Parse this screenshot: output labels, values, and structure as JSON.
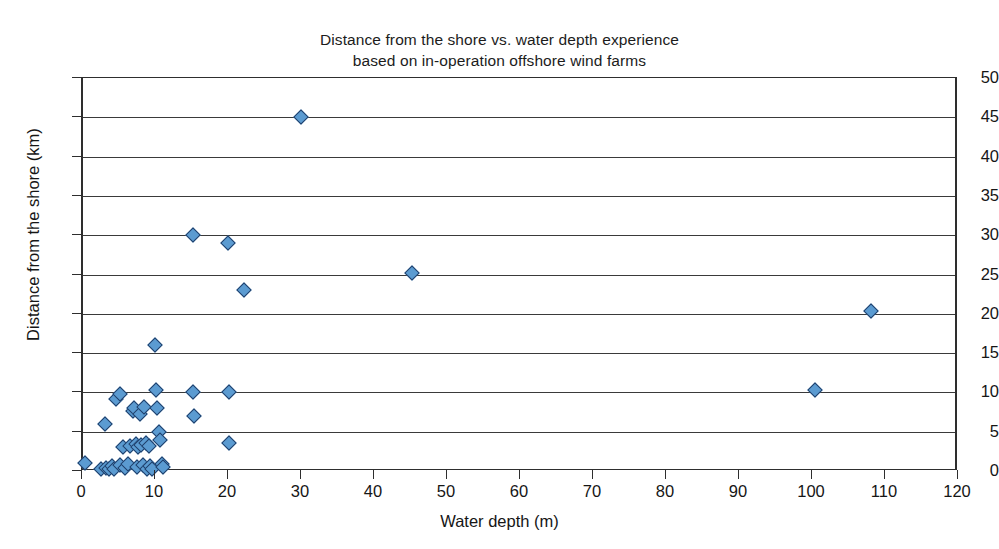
{
  "chart_data": {
    "type": "scatter",
    "title": "Distance from the shore vs. water depth experience\nbased on in-operation offshore wind farms",
    "title_line1": "Distance from the shore vs. water depth experience",
    "title_line2": "based on in-operation offshore wind farms",
    "xlabel": "Water depth (m)",
    "ylabel": "Distance from the shore (km)",
    "xlim": [
      0,
      120
    ],
    "ylim": [
      0,
      50
    ],
    "xticks": [
      0,
      10,
      20,
      30,
      40,
      50,
      60,
      70,
      80,
      90,
      100,
      110,
      120
    ],
    "yticks": [
      0,
      5,
      10,
      15,
      20,
      25,
      30,
      35,
      40,
      45,
      50
    ],
    "xtick_labels": [
      "0",
      "10",
      "20",
      "30",
      "40",
      "50",
      "60",
      "70",
      "80",
      "90",
      "100",
      "110",
      "120"
    ],
    "ytick_labels": [
      "0",
      "5",
      "10",
      "15",
      "20",
      "25",
      "30",
      "35",
      "40",
      "45",
      "50"
    ],
    "grid": "horizontal",
    "legend": "none",
    "marker": "diamond",
    "marker_fill": "#5b9bd1",
    "marker_edge": "#1f3f6b",
    "points": [
      {
        "x": 0.3,
        "y": 1.0
      },
      {
        "x": 2.5,
        "y": 0.3
      },
      {
        "x": 3.0,
        "y": 6.0
      },
      {
        "x": 3.2,
        "y": 0.4
      },
      {
        "x": 3.6,
        "y": 0.2
      },
      {
        "x": 4.0,
        "y": 0.6
      },
      {
        "x": 4.2,
        "y": 0.3
      },
      {
        "x": 4.5,
        "y": 9.2
      },
      {
        "x": 5.0,
        "y": 9.8
      },
      {
        "x": 5.0,
        "y": 0.8
      },
      {
        "x": 5.5,
        "y": 3.0
      },
      {
        "x": 5.8,
        "y": 0.4
      },
      {
        "x": 6.2,
        "y": 0.9
      },
      {
        "x": 6.5,
        "y": 3.2
      },
      {
        "x": 6.8,
        "y": 7.6
      },
      {
        "x": 7.0,
        "y": 8.0
      },
      {
        "x": 7.2,
        "y": 3.4
      },
      {
        "x": 7.4,
        "y": 0.5
      },
      {
        "x": 7.6,
        "y": 3.1
      },
      {
        "x": 7.8,
        "y": 7.3
      },
      {
        "x": 8.0,
        "y": 3.3
      },
      {
        "x": 8.2,
        "y": 0.7
      },
      {
        "x": 8.4,
        "y": 8.2
      },
      {
        "x": 8.6,
        "y": 3.5
      },
      {
        "x": 8.8,
        "y": 0.3
      },
      {
        "x": 9.0,
        "y": 3.2
      },
      {
        "x": 9.2,
        "y": 0.6
      },
      {
        "x": 9.5,
        "y": 0.2
      },
      {
        "x": 9.8,
        "y": 16.0
      },
      {
        "x": 10.0,
        "y": 10.3
      },
      {
        "x": 10.2,
        "y": 8.0
      },
      {
        "x": 10.4,
        "y": 5.0
      },
      {
        "x": 10.6,
        "y": 4.0
      },
      {
        "x": 10.8,
        "y": 0.9
      },
      {
        "x": 11.0,
        "y": 0.5
      },
      {
        "x": 15.0,
        "y": 30.0
      },
      {
        "x": 15.0,
        "y": 10.0
      },
      {
        "x": 15.2,
        "y": 7.0
      },
      {
        "x": 19.8,
        "y": 29.0
      },
      {
        "x": 20.0,
        "y": 10.0
      },
      {
        "x": 20.0,
        "y": 3.5
      },
      {
        "x": 22.0,
        "y": 23.0
      },
      {
        "x": 29.8,
        "y": 45.0
      },
      {
        "x": 45.0,
        "y": 25.2
      },
      {
        "x": 100.3,
        "y": 10.3
      },
      {
        "x": 108.0,
        "y": 20.3
      }
    ]
  }
}
